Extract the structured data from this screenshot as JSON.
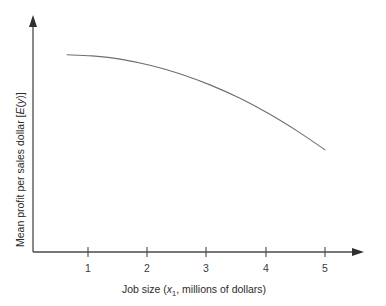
{
  "figure": {
    "background_color": "#ffffff",
    "line_color": "#6e6e6e",
    "axis_color": "#4a4a4a",
    "text_color": "#2b2b2b"
  },
  "axes": {
    "x": {
      "title_parts": {
        "prefix": "Job size (",
        "variable": "x",
        "subscript": "1",
        "suffix": ", millions of dollars)"
      },
      "title_full": "Job size (x1, millions of dollars)",
      "tick_labels": [
        "1",
        "2",
        "3",
        "4",
        "5"
      ],
      "has_arrowhead": "true"
    },
    "y": {
      "title_parts": {
        "prefix": "Mean profit per sales dollar [",
        "variable_e": "E",
        "open_paren": "(",
        "variable_y": "y",
        "close": ")]"
      },
      "title_full": "Mean profit per sales dollar [E(y)]",
      "tick_labels": [],
      "has_arrowhead": "true"
    }
  },
  "chart_data": {
    "type": "line",
    "title": "",
    "subtitle": "",
    "xlabel": "Job size (x1, millions of dollars)",
    "ylabel": "Mean profit per sales dollar [E(y)]",
    "xlim": [
      0,
      5.6
    ],
    "ylim": [
      0,
      1.0
    ],
    "grid": false,
    "legend": "none",
    "xticks": [
      1,
      2,
      3,
      4,
      5
    ],
    "yticks": [],
    "series": [
      {
        "name": "Mean profit per sales dollar",
        "x": [
          0.58,
          1.0,
          1.5,
          2.0,
          2.5,
          3.0,
          3.5,
          4.0,
          4.5,
          4.95
        ],
        "y": [
          0.865,
          0.86,
          0.845,
          0.818,
          0.781,
          0.733,
          0.675,
          0.606,
          0.527,
          0.448
        ],
        "shape": "concave-down decreasing quadratic"
      }
    ],
    "annotations": []
  }
}
